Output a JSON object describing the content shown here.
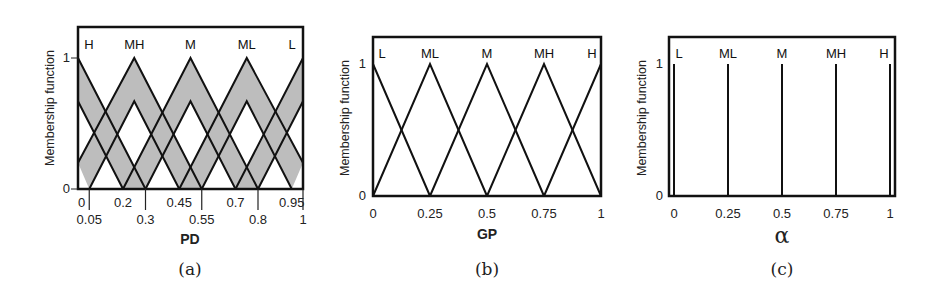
{
  "chart_data": [
    {
      "id": "a",
      "type": "line",
      "caption": "(a)",
      "title": "",
      "xlabel": "PD",
      "ylabel": "Membership function",
      "xlim": [
        0,
        1
      ],
      "ylim": [
        0,
        1.2
      ],
      "y_ticks": [
        "0",
        "1"
      ],
      "x_ticks_upper_row": [
        "0",
        "0.2",
        "0.45",
        "0.7",
        "0.95"
      ],
      "x_ticks_lower_row": [
        "0.05",
        "0.3",
        "0.55",
        "0.8",
        "1"
      ],
      "grid": false,
      "shaded_footprint_of_uncertainty": true,
      "fill_color": "#bdbdbd",
      "labels": [
        "H",
        "MH",
        "M",
        "ML",
        "L"
      ],
      "label_positions": [
        0,
        0.25,
        0.5,
        0.75,
        1
      ],
      "series": [
        {
          "name": "H",
          "upper": {
            "x": [
              0,
              0,
              0.3
            ],
            "y": [
              0,
              1,
              0
            ]
          },
          "lower": {
            "x": [
              0,
              0,
              0.2
            ],
            "y": [
              0,
              0.67,
              0
            ]
          }
        },
        {
          "name": "MH",
          "upper": {
            "x": [
              0,
              0.25,
              0.55
            ],
            "y": [
              0.2,
              1,
              0
            ]
          },
          "lower": {
            "x": [
              0.05,
              0.25,
              0.45
            ],
            "y": [
              0,
              0.67,
              0
            ]
          }
        },
        {
          "name": "M",
          "upper": {
            "x": [
              0.2,
              0.5,
              0.8
            ],
            "y": [
              0,
              1,
              0
            ]
          },
          "lower": {
            "x": [
              0.3,
              0.5,
              0.7
            ],
            "y": [
              0,
              0.67,
              0
            ]
          }
        },
        {
          "name": "ML",
          "upper": {
            "x": [
              0.45,
              0.75,
              1.0
            ],
            "y": [
              0,
              1,
              0.2
            ]
          },
          "lower": {
            "x": [
              0.55,
              0.75,
              0.95
            ],
            "y": [
              0,
              0.67,
              0
            ]
          }
        },
        {
          "name": "L",
          "upper": {
            "x": [
              0.7,
              1,
              1
            ],
            "y": [
              0,
              1,
              0
            ]
          },
          "lower": {
            "x": [
              0.8,
              1,
              1
            ],
            "y": [
              0,
              0.67,
              0
            ]
          }
        }
      ]
    },
    {
      "id": "b",
      "type": "line",
      "caption": "(b)",
      "title": "",
      "xlabel": "GP",
      "ylabel": "Membership function",
      "xlim": [
        0,
        1
      ],
      "ylim": [
        0,
        1.2
      ],
      "y_ticks": [
        "0",
        "1"
      ],
      "x_ticks": [
        "0",
        "0.25",
        "0.5",
        "0.75",
        "1"
      ],
      "grid": false,
      "labels": [
        "L",
        "ML",
        "M",
        "MH",
        "H"
      ],
      "series": [
        {
          "name": "L",
          "x": [
            0,
            0,
            0.25
          ],
          "y": [
            0,
            1,
            0
          ]
        },
        {
          "name": "ML",
          "x": [
            0,
            0.25,
            0.5
          ],
          "y": [
            0,
            1,
            0
          ]
        },
        {
          "name": "M",
          "x": [
            0.25,
            0.5,
            0.75
          ],
          "y": [
            0,
            1,
            0
          ]
        },
        {
          "name": "MH",
          "x": [
            0.5,
            0.75,
            1
          ],
          "y": [
            0,
            1,
            0
          ]
        },
        {
          "name": "H",
          "x": [
            0.75,
            1,
            1
          ],
          "y": [
            0,
            1,
            0
          ]
        }
      ]
    },
    {
      "id": "c",
      "type": "line",
      "caption": "(c)",
      "title": "",
      "xlabel": "α",
      "ylabel": "Membership function",
      "xlim": [
        0,
        1
      ],
      "ylim": [
        0,
        1.2
      ],
      "y_ticks": [
        "0",
        "1"
      ],
      "x_ticks": [
        "0",
        "0.25",
        "0.5",
        "0.75",
        "1"
      ],
      "grid": false,
      "labels": [
        "L",
        "ML",
        "M",
        "MH",
        "H"
      ],
      "series": [
        {
          "name": "L",
          "x": 0,
          "y": 1,
          "kind": "singleton"
        },
        {
          "name": "ML",
          "x": 0.25,
          "y": 1,
          "kind": "singleton"
        },
        {
          "name": "M",
          "x": 0.5,
          "y": 1,
          "kind": "singleton"
        },
        {
          "name": "MH",
          "x": 0.75,
          "y": 1,
          "kind": "singleton"
        },
        {
          "name": "H",
          "x": 1,
          "y": 1,
          "kind": "singleton"
        }
      ]
    }
  ]
}
